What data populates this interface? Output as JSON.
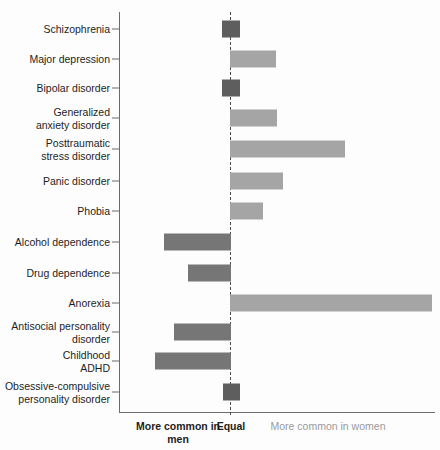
{
  "chart_data": {
    "type": "bar",
    "orientation": "horizontal-diverging",
    "title": "",
    "xlabel": "",
    "ylabel": "",
    "grid": false,
    "legend_position": "below-axis",
    "axis_captions": {
      "left": "More common\nin men",
      "center": "Equal",
      "right": "More common\nin women"
    },
    "colors": {
      "men": "#767676",
      "women": "#a5a5a5",
      "equal": "#5e5e5e",
      "axis": "#6b6b6b",
      "equal_line": "#4a4a4a",
      "background": "#fdfdfd",
      "label_text": "#1d1d1d",
      "muted_text": "#9a9a9a"
    },
    "x_zero_px": 230,
    "x_axis_left_px": 119,
    "x_axis_right_px": 435,
    "categories": [
      "Schizophrenia",
      "Major depression",
      "Bipolar disorder",
      "Generalized\nanxiety disorder",
      "Posttraumatic\nstress disorder",
      "Panic disorder",
      "Phobia",
      "Alcohol dependence",
      "Drug dependence",
      "Anorexia",
      "Antisocial personality\ndisorder",
      "Childhood\nADHD",
      "Obsessive-compulsive\npersonality disorder"
    ],
    "bars": [
      {
        "label": "Schizophrenia",
        "direction": "equal",
        "start_px": 222,
        "end_px": 240,
        "row_top_px": 14,
        "value": 0
      },
      {
        "label": "Major depression",
        "direction": "women",
        "start_px": 230,
        "end_px": 276,
        "row_top_px": 44,
        "value": 46
      },
      {
        "label": "Bipolar disorder",
        "direction": "equal",
        "start_px": 222,
        "end_px": 240,
        "row_top_px": 73,
        "value": 0
      },
      {
        "label": "Generalized anxiety disorder",
        "direction": "women",
        "start_px": 230,
        "end_px": 277,
        "row_top_px": 103,
        "value": 47
      },
      {
        "label": "Posttraumatic stress disorder",
        "direction": "women",
        "start_px": 230,
        "end_px": 345,
        "row_top_px": 134,
        "value": 115
      },
      {
        "label": "Panic disorder",
        "direction": "women",
        "start_px": 230,
        "end_px": 283,
        "row_top_px": 166,
        "value": 53
      },
      {
        "label": "Phobia",
        "direction": "women",
        "start_px": 230,
        "end_px": 263,
        "row_top_px": 196,
        "value": 33
      },
      {
        "label": "Alcohol dependence",
        "direction": "men",
        "start_px": 164,
        "end_px": 231,
        "row_top_px": 227,
        "value": -66
      },
      {
        "label": "Drug dependence",
        "direction": "men",
        "start_px": 188,
        "end_px": 231,
        "row_top_px": 258,
        "value": -42
      },
      {
        "label": "Anorexia",
        "direction": "women",
        "start_px": 230,
        "end_px": 432,
        "row_top_px": 288,
        "value": 202
      },
      {
        "label": "Antisocial personality disorder",
        "direction": "men",
        "start_px": 174,
        "end_px": 231,
        "row_top_px": 317,
        "value": -56
      },
      {
        "label": "Childhood ADHD",
        "direction": "men",
        "start_px": 155,
        "end_px": 231,
        "row_top_px": 346,
        "value": -75
      },
      {
        "label": "Obsessive-compulsive personality disorder",
        "direction": "equal",
        "start_px": 223,
        "end_px": 240,
        "row_top_px": 377,
        "value": 0
      }
    ]
  }
}
